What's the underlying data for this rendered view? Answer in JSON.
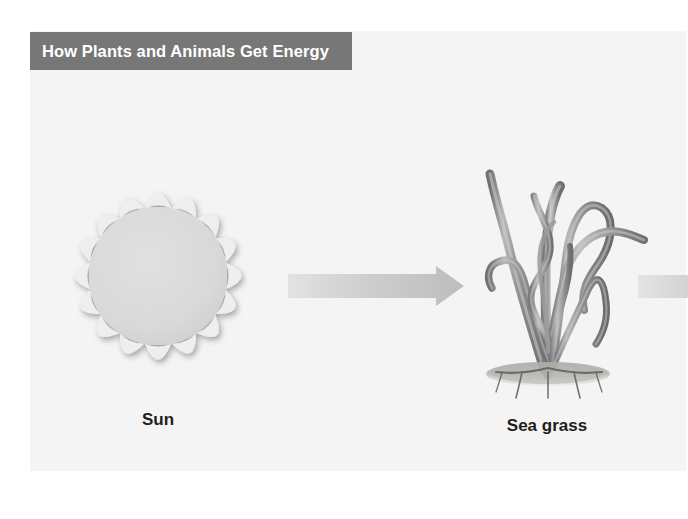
{
  "document": {
    "title": "How Plants and Animals Get Energy",
    "background_color": "#ffffff",
    "panel_color": "#f4f4f4"
  },
  "banner": {
    "label": "How Plants and Animals Get Energy",
    "background_color": "#777777",
    "text_color": "#ffffff"
  },
  "diagram": {
    "type": "energy-flow-chain",
    "flow_direction": "left-to-right",
    "nodes": [
      {
        "id": "sun",
        "caption": "Sun",
        "icon": "sun-icon",
        "color": "#d8d8d8",
        "ray_count": 16
      },
      {
        "id": "sea-grass",
        "caption": "Sea grass",
        "icon": "sea-grass-icon",
        "color": "#8c8c8c",
        "sand_color": "#b9b6b2"
      }
    ],
    "connectors": [
      {
        "id": "arrow-1",
        "icon": "right-arrow-icon",
        "from": "sun",
        "to": "sea-grass",
        "color": "#c9c9c9",
        "complete": true
      },
      {
        "id": "arrow-2",
        "icon": "right-arrow-icon",
        "from": "sea-grass",
        "to": "",
        "color": "#c9c9c9",
        "complete": false
      }
    ]
  },
  "captions": {
    "sun": "Sun",
    "sea_grass": "Sea grass"
  },
  "colors": {
    "banner": "#777777",
    "panel": "#f4f4f4",
    "page": "#ffffff",
    "arrow": "#c9c9c9",
    "sun_disc": "#d8d8d8",
    "sun_ray": "#ececec",
    "grass_dark": "#6f6f6f",
    "grass_mid": "#9a9a9a",
    "grass_light": "#c4c4c4",
    "caption_text": "#1d1d1d"
  }
}
